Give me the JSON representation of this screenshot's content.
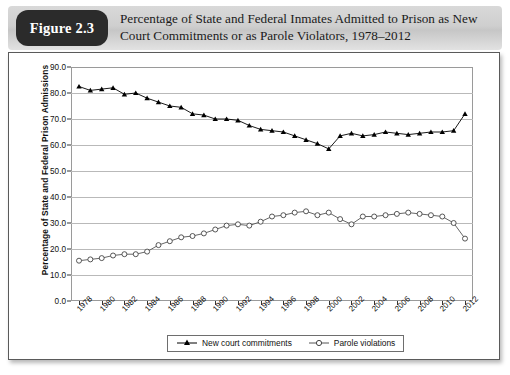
{
  "figure": {
    "badge_label": "Figure 2.3",
    "title_line1": "Percentage of State and Federal Inmates Admitted to Prison as New",
    "title_line2": "Court Commitments or as Parole Violators, 1978–2012"
  },
  "legend": {
    "items": [
      {
        "label": "New court commitments",
        "marker": "filled-triangle",
        "color": "#000000"
      },
      {
        "label": "Parole violations",
        "marker": "open-circle",
        "color": "#555555"
      }
    ]
  },
  "chart_data": {
    "type": "line",
    "title": "Percentage of State and Federal Inmates Admitted to Prison as New Court Commitments or as Parole Violators, 1978–2012",
    "xlabel": "",
    "ylabel": "Percentage of State and Federal Prison Admissions",
    "ylim": [
      0.0,
      90.0
    ],
    "yticks": [
      "0.0",
      "10.0",
      "20.0",
      "30.0",
      "40.0",
      "50.0",
      "60.0",
      "70.0",
      "80.0",
      "90.0"
    ],
    "ytick_values": [
      0,
      10,
      20,
      30,
      40,
      50,
      60,
      70,
      80,
      90
    ],
    "grid": true,
    "legend_position": "bottom",
    "x": [
      1978,
      1979,
      1980,
      1981,
      1982,
      1983,
      1984,
      1985,
      1986,
      1987,
      1988,
      1989,
      1990,
      1991,
      1992,
      1993,
      1994,
      1995,
      1996,
      1997,
      1998,
      1999,
      2000,
      2001,
      2002,
      2003,
      2004,
      2005,
      2006,
      2007,
      2008,
      2009,
      2010,
      2011,
      2012
    ],
    "xtick_labels": [
      "1978",
      "1980",
      "1982",
      "1984",
      "1986",
      "1988",
      "1990",
      "1992",
      "1994",
      "1996",
      "1998",
      "2000",
      "2002",
      "2004",
      "2006",
      "2008",
      "2010",
      "2012"
    ],
    "xtick_values": [
      1978,
      1980,
      1982,
      1984,
      1986,
      1988,
      1990,
      1992,
      1994,
      1996,
      1998,
      2000,
      2002,
      2004,
      2006,
      2008,
      2010,
      2012
    ],
    "series": [
      {
        "name": "New court commitments",
        "marker": "filled-triangle",
        "color": "#000000",
        "values": [
          82.5,
          81.0,
          81.5,
          82.0,
          79.5,
          80.0,
          78.0,
          76.5,
          75.0,
          74.5,
          72.0,
          71.5,
          70.0,
          70.0,
          69.5,
          67.5,
          66.0,
          65.5,
          65.0,
          63.5,
          62.0,
          60.5,
          58.5,
          63.5,
          64.5,
          63.5,
          64.0,
          65.0,
          64.5,
          64.0,
          64.5,
          65.0,
          65.0,
          65.5,
          72.0
        ]
      },
      {
        "name": "Parole violations",
        "marker": "open-circle",
        "color": "#555555",
        "values": [
          15.5,
          16.0,
          16.5,
          17.5,
          18.0,
          18.0,
          19.0,
          21.5,
          23.0,
          24.5,
          25.0,
          26.0,
          27.5,
          29.0,
          29.5,
          29.0,
          30.5,
          32.5,
          33.0,
          34.0,
          34.5,
          33.0,
          34.0,
          31.5,
          29.5,
          32.5,
          32.5,
          33.0,
          33.5,
          34.0,
          33.5,
          33.0,
          32.5,
          30.0,
          24.0
        ]
      }
    ]
  }
}
